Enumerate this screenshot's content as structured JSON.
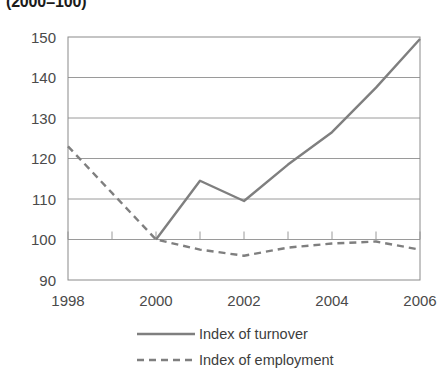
{
  "chart_data": {
    "type": "line",
    "title": "(2000=100)",
    "xlabel": "",
    "ylabel": "",
    "x": [
      1998,
      1999,
      2000,
      2001,
      2002,
      2003,
      2004,
      2005,
      2006
    ],
    "xtick_labels": [
      "1998",
      "2000",
      "2002",
      "2004",
      "2006"
    ],
    "xtick_values": [
      1998,
      2000,
      2002,
      2004,
      2006
    ],
    "ytick_labels": [
      "90",
      "100",
      "110",
      "120",
      "130",
      "140",
      "150"
    ],
    "ytick_values": [
      90,
      100,
      110,
      120,
      130,
      140,
      150
    ],
    "xlim": [
      1998,
      2006
    ],
    "ylim": [
      90,
      150
    ],
    "grid": true,
    "legend_position": "bottom",
    "series": [
      {
        "name": "Index of turnover",
        "style": "solid",
        "color": "#7f7f7f",
        "values": [
          null,
          null,
          100.0,
          114.5,
          109.5,
          118.5,
          126.5,
          137.5,
          149.5
        ]
      },
      {
        "name": "Index of employment",
        "style": "dashed",
        "color": "#7f7f7f",
        "values": [
          123.0,
          111.5,
          100.0,
          97.5,
          96.0,
          98.0,
          99.0,
          99.5,
          97.5
        ]
      }
    ]
  },
  "legend": {
    "items": [
      {
        "label": "Index of turnover",
        "style": "solid"
      },
      {
        "label": "Index of employment",
        "style": "dashed"
      }
    ]
  },
  "colors": {
    "line": "#7f7f7f",
    "axis": "#8a8a8a",
    "grid": "#9a9a9a",
    "text": "#4a4a4a",
    "title": "#1b1b1b"
  }
}
